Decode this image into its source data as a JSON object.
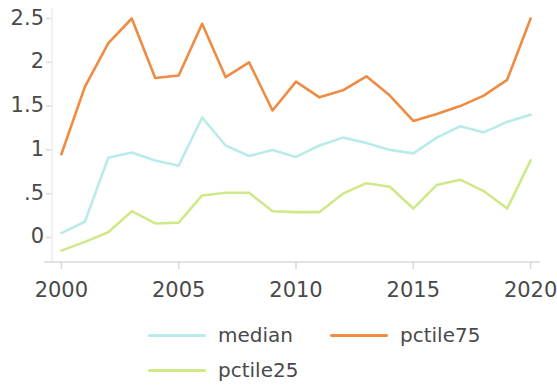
{
  "chart_data": {
    "type": "line",
    "title": "",
    "subtitle": "",
    "xlabel": "",
    "ylabel": "",
    "x": [
      2000,
      2001,
      2002,
      2003,
      2004,
      2005,
      2006,
      2007,
      2008,
      2009,
      2010,
      2011,
      2012,
      2013,
      2014,
      2015,
      2016,
      2017,
      2018,
      2019,
      2020
    ],
    "xlim": [
      1999.6,
      2020.4
    ],
    "ylim": [
      -0.28,
      2.62
    ],
    "xticks": [
      2000,
      2005,
      2010,
      2015,
      2020
    ],
    "xtick_labels": [
      "2000",
      "2005",
      "2010",
      "2015",
      "2020"
    ],
    "yticks": [
      0,
      0.5,
      1,
      1.5,
      2,
      2.5
    ],
    "ytick_labels": [
      "0",
      ".5",
      "1",
      "1.5",
      "2",
      "2.5"
    ],
    "grid": false,
    "legend_position": "bottom",
    "series": [
      {
        "name": "median",
        "color": "#b9ece9",
        "values": [
          0.05,
          0.18,
          0.91,
          0.97,
          0.88,
          0.82,
          1.37,
          1.05,
          0.93,
          1.0,
          0.92,
          1.05,
          1.14,
          1.08,
          1.0,
          0.96,
          1.14,
          1.27,
          1.2,
          1.32,
          1.4
        ]
      },
      {
        "name": "pctile75",
        "color": "#ef8b42",
        "values": [
          0.95,
          1.72,
          2.22,
          2.5,
          1.82,
          1.85,
          2.44,
          1.83,
          2.0,
          1.45,
          1.78,
          1.6,
          1.68,
          1.84,
          1.62,
          1.33,
          1.41,
          1.5,
          1.62,
          1.8,
          2.5
        ]
      },
      {
        "name": "pctile25",
        "color": "#cfe98a",
        "values": [
          -0.15,
          -0.05,
          0.06,
          0.3,
          0.16,
          0.17,
          0.48,
          0.51,
          0.51,
          0.3,
          0.29,
          0.29,
          0.5,
          0.62,
          0.58,
          0.33,
          0.6,
          0.66,
          0.53,
          0.33,
          0.88
        ]
      }
    ]
  },
  "legend": {
    "items": [
      {
        "label": "median",
        "color": "#b9ece9"
      },
      {
        "label": "pctile75",
        "color": "#ef8b42"
      },
      {
        "label": "pctile25",
        "color": "#cfe98a"
      }
    ]
  },
  "axes": {
    "tick_color": "#d9d9d9",
    "label_color": "#4a4a4a",
    "background": "#ffffff"
  }
}
